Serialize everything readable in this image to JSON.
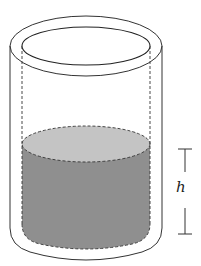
{
  "figure": {
    "label_h": "h",
    "colors": {
      "stroke": "#333333",
      "liquid_side": "#8f8f8f",
      "liquid_top": "#c4c4c4",
      "background": "#ffffff"
    }
  }
}
